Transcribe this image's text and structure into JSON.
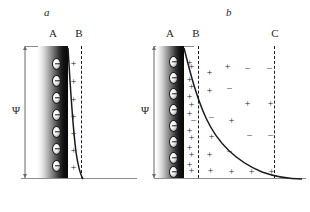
{
  "figure": {
    "title": "",
    "background": "#ffffff",
    "width": 310,
    "height": 212
  },
  "panels": [
    {
      "id": "a",
      "title": "a",
      "model": "helmholtz-double-layer",
      "plane_labels": [
        {
          "name": "A",
          "text": "A",
          "x": 52
        },
        {
          "name": "B",
          "text": "B",
          "x": 78
        }
      ],
      "potential_label": "Ψ",
      "surface_charge_sign": "−",
      "surface_charge_count": 7,
      "counter_charges": {
        "sign": "+",
        "count": 7
      },
      "dashed_planes": [
        "B"
      ],
      "curve_description": "steep linear-to-concave potential drop from surface to plane B"
    },
    {
      "id": "b",
      "title": "b",
      "model": "gouy-chapman-stern-double-layer",
      "plane_labels": [
        {
          "name": "A",
          "text": "A",
          "x": 19
        },
        {
          "name": "B",
          "text": "B",
          "x": 45
        },
        {
          "name": "C",
          "text": "C",
          "x": 124
        }
      ],
      "potential_label": "Ψ",
      "stern_label": "ε",
      "zeta_label": "ξ",
      "surface_charge_sign": "−",
      "surface_charge_count": 8,
      "inner_counter_charges": {
        "sign": "+",
        "count": 8
      },
      "dashed_planes": [
        "B",
        "C"
      ],
      "curve_description": "exponential decay of potential through the diffuse layer",
      "diffuse_charges": [
        {
          "sign": "+",
          "x": 38,
          "y": 62
        },
        {
          "sign": "+",
          "x": 56,
          "y": 68
        },
        {
          "sign": "+",
          "x": 74,
          "y": 62
        },
        {
          "sign": "−",
          "x": 94,
          "y": 64
        },
        {
          "sign": "−",
          "x": 116,
          "y": 64
        },
        {
          "sign": "+",
          "x": 38,
          "y": 82
        },
        {
          "sign": "+",
          "x": 56,
          "y": 86
        },
        {
          "sign": "−",
          "x": 76,
          "y": 84
        },
        {
          "sign": "+",
          "x": 38,
          "y": 100
        },
        {
          "sign": "+",
          "x": 94,
          "y": 99
        },
        {
          "sign": "+",
          "x": 117,
          "y": 99
        },
        {
          "sign": "−",
          "x": 40,
          "y": 116
        },
        {
          "sign": "−",
          "x": 58,
          "y": 113
        },
        {
          "sign": "+",
          "x": 78,
          "y": 116
        },
        {
          "sign": "+",
          "x": 38,
          "y": 133
        },
        {
          "sign": "+",
          "x": 58,
          "y": 132
        },
        {
          "sign": "−",
          "x": 96,
          "y": 131
        },
        {
          "sign": "−",
          "x": 117,
          "y": 131
        },
        {
          "sign": "+",
          "x": 38,
          "y": 150
        },
        {
          "sign": "+",
          "x": 56,
          "y": 150
        },
        {
          "sign": "−",
          "x": 76,
          "y": 147
        },
        {
          "sign": "+",
          "x": 38,
          "y": 166
        },
        {
          "sign": "+",
          "x": 57,
          "y": 166
        },
        {
          "sign": "+",
          "x": 78,
          "y": 167
        },
        {
          "sign": "+",
          "x": 98,
          "y": 167
        },
        {
          "sign": "+",
          "x": 118,
          "y": 167
        }
      ]
    }
  ]
}
